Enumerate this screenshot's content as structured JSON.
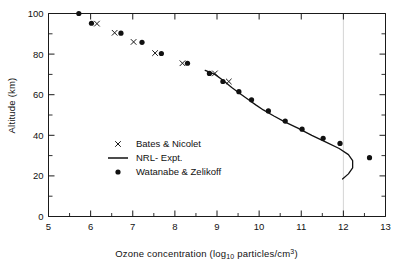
{
  "chart_data": {
    "type": "scatter",
    "title": "",
    "xlabel": "Ozone concentration (log10 particles/cm3)",
    "ylabel": "Altitude (km)",
    "xlim": [
      5,
      13
    ],
    "ylim": [
      0,
      100
    ],
    "xticks": [
      5,
      6,
      7,
      8,
      9,
      10,
      11,
      12,
      13
    ],
    "yticks": [
      0,
      20,
      40,
      60,
      80,
      100
    ],
    "xminor_step": 0.5,
    "yminor_step": 10,
    "grid": false,
    "gridline_vertical_x": 12,
    "legend_position": "center-left",
    "series": [
      {
        "name": "Bates & Nicolet",
        "marker": "x",
        "points": [
          {
            "x": 6.15,
            "y": 95.0
          },
          {
            "x": 6.57,
            "y": 90.5
          },
          {
            "x": 7.02,
            "y": 86.0
          },
          {
            "x": 7.53,
            "y": 80.5
          },
          {
            "x": 8.18,
            "y": 75.5
          },
          {
            "x": 8.95,
            "y": 70.5
          },
          {
            "x": 9.28,
            "y": 66.5
          }
        ]
      },
      {
        "name": "Watanabe & Zelikoff",
        "marker": "dot",
        "points": [
          {
            "x": 5.72,
            "y": 100.0
          },
          {
            "x": 6.02,
            "y": 95.2
          },
          {
            "x": 6.72,
            "y": 90.3
          },
          {
            "x": 7.22,
            "y": 85.8
          },
          {
            "x": 7.68,
            "y": 80.3
          },
          {
            "x": 8.3,
            "y": 75.5
          },
          {
            "x": 8.82,
            "y": 70.5
          },
          {
            "x": 9.14,
            "y": 66.5
          },
          {
            "x": 9.52,
            "y": 61.5
          },
          {
            "x": 9.82,
            "y": 57.5
          },
          {
            "x": 10.22,
            "y": 52.0
          },
          {
            "x": 10.62,
            "y": 47.0
          },
          {
            "x": 11.02,
            "y": 43.0
          },
          {
            "x": 11.52,
            "y": 38.5
          },
          {
            "x": 11.92,
            "y": 36.0
          },
          {
            "x": 12.62,
            "y": 29.0
          }
        ]
      },
      {
        "name": "NRL-Expt.",
        "marker": "line",
        "points": [
          {
            "x": 8.72,
            "y": 72.0
          },
          {
            "x": 8.95,
            "y": 70.0
          },
          {
            "x": 9.15,
            "y": 67.0
          },
          {
            "x": 9.35,
            "y": 63.5
          },
          {
            "x": 9.55,
            "y": 60.5
          },
          {
            "x": 9.75,
            "y": 57.5
          },
          {
            "x": 9.92,
            "y": 55.0
          },
          {
            "x": 10.1,
            "y": 52.5
          },
          {
            "x": 10.35,
            "y": 49.5
          },
          {
            "x": 10.62,
            "y": 46.5
          },
          {
            "x": 10.92,
            "y": 43.5
          },
          {
            "x": 11.25,
            "y": 40.0
          },
          {
            "x": 11.6,
            "y": 36.5
          },
          {
            "x": 11.9,
            "y": 33.5
          },
          {
            "x": 12.12,
            "y": 30.5
          },
          {
            "x": 12.22,
            "y": 27.5
          },
          {
            "x": 12.22,
            "y": 24.0
          },
          {
            "x": 12.12,
            "y": 21.0
          },
          {
            "x": 11.98,
            "y": 18.5
          }
        ]
      }
    ]
  },
  "axes": {
    "x_title_main": "Ozone concentration  (log",
    "x_title_sub": "10",
    "x_title_mid": " particles/cm",
    "x_title_sup": "3",
    "x_title_end": ")",
    "y_title": "Altitude (km)"
  },
  "legend": {
    "entries": [
      {
        "label": "Bates & Nicolet",
        "symbol": "x-marker"
      },
      {
        "label": "NRL- Expt.",
        "symbol": "line-marker"
      },
      {
        "label": "Watanabe & Zelikoff",
        "symbol": "dot-marker"
      }
    ]
  }
}
